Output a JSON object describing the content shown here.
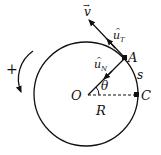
{
  "diagram": {
    "labels": {
      "velocity": "v",
      "velocity_arrow": "→",
      "unit_tangent": "u",
      "unit_tangent_sub": "T",
      "unit_normal": "u",
      "unit_normal_sub": "N",
      "hat": "^",
      "point_a": "A",
      "point_c": "C",
      "origin": "O",
      "radius": "R",
      "angle": "θ",
      "arc_length": "s",
      "positive_direction": "+"
    },
    "colors": {
      "stroke": "#111111",
      "background": "#ffffff"
    }
  }
}
